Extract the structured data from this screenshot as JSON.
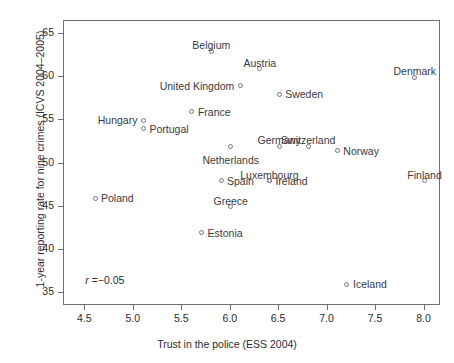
{
  "chart_data": {
    "type": "scatter",
    "title": "",
    "xlabel": "Trust in the police (ESS 2004)",
    "ylabel": "1-year reporting rate for nine crimes (ICVS 2004–2005)",
    "xlim": [
      4.28,
      8.17
    ],
    "ylim": [
      33.5,
      66.5
    ],
    "xticks": [
      "4.5",
      "5.0",
      "5.5",
      "6.0",
      "6.5",
      "7.0",
      "7.5",
      "8.0"
    ],
    "xtick_values": [
      4.5,
      5.0,
      5.5,
      6.0,
      6.5,
      7.0,
      7.5,
      8.0
    ],
    "yticks": [
      "35",
      "40",
      "45",
      "50",
      "55",
      "60",
      "65"
    ],
    "ytick_values": [
      35,
      40,
      45,
      50,
      55,
      60,
      65
    ],
    "grid": false,
    "legend": null,
    "annotations": [
      {
        "text": "r = −0.05",
        "symbol": "r",
        "operator": "=",
        "value": "−0.05",
        "x": 4.5,
        "y": 36.5
      }
    ],
    "points": [
      {
        "label": "Belgium",
        "x": 5.8,
        "y": 63.0,
        "label_pos": "above"
      },
      {
        "label": "Austria",
        "x": 6.3,
        "y": 61.0,
        "label_pos": "above"
      },
      {
        "label": "Denmark",
        "x": 7.9,
        "y": 60.0,
        "label_pos": "above"
      },
      {
        "label": "United Kingdom",
        "x": 6.1,
        "y": 59.0,
        "label_pos": "left"
      },
      {
        "label": "Sweden",
        "x": 6.5,
        "y": 58.0,
        "label_pos": "right"
      },
      {
        "label": "France",
        "x": 5.6,
        "y": 56.0,
        "label_pos": "right"
      },
      {
        "label": "Hungary",
        "x": 5.1,
        "y": 55.0,
        "label_pos": "left"
      },
      {
        "label": "Portugal",
        "x": 5.1,
        "y": 54.0,
        "label_pos": "right"
      },
      {
        "label": "Germany",
        "x": 6.5,
        "y": 52.0,
        "label_pos": "above"
      },
      {
        "label": "Switzerland",
        "x": 6.8,
        "y": 52.0,
        "label_pos": "above"
      },
      {
        "label": "Netherlands",
        "x": 6.0,
        "y": 52.0,
        "label_pos": "below"
      },
      {
        "label": "Norway",
        "x": 7.1,
        "y": 51.5,
        "label_pos": "right"
      },
      {
        "label": "Spain",
        "x": 5.9,
        "y": 48.0,
        "label_pos": "right"
      },
      {
        "label": "Luxembourg",
        "x": 6.4,
        "y": 48.0,
        "label_pos": "above"
      },
      {
        "label": "Ireland",
        "x": 6.4,
        "y": 48.0,
        "label_pos": "right"
      },
      {
        "label": "Finland",
        "x": 8.0,
        "y": 48.0,
        "label_pos": "above"
      },
      {
        "label": "Poland",
        "x": 4.6,
        "y": 46.0,
        "label_pos": "right"
      },
      {
        "label": "Greece",
        "x": 6.0,
        "y": 45.0,
        "label_pos": "above"
      },
      {
        "label": "Estonia",
        "x": 5.7,
        "y": 42.0,
        "label_pos": "right"
      },
      {
        "label": "Iceland",
        "x": 7.2,
        "y": 36.0,
        "label_pos": "right"
      }
    ]
  }
}
